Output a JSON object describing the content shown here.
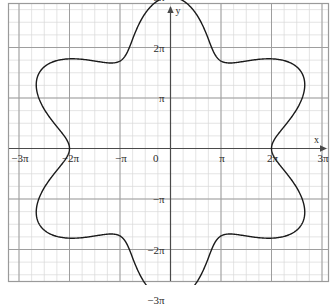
{
  "figure": {
    "title": "",
    "background_color": "#ffffff",
    "border_color": "#9a9a9a",
    "curve_color": "#1a1a1a",
    "axis_color": "#4a4a4a",
    "major_grid_color": "#9a9a9a",
    "minor_grid_color": "#d2d2d2"
  },
  "axes": {
    "x_axis_name": "x",
    "y_axis_name": "y",
    "origin_label": "0"
  },
  "x_ticks": [
    {
      "label": "−3π",
      "value": -3
    },
    {
      "label": "−2π",
      "value": -2
    },
    {
      "label": "−π",
      "value": -1
    },
    {
      "label": "0",
      "value": 0
    },
    {
      "label": "π",
      "value": 1
    },
    {
      "label": "2π",
      "value": 2
    },
    {
      "label": "3π",
      "value": 3
    }
  ],
  "y_ticks": [
    {
      "label": "3π",
      "value": 3
    },
    {
      "label": "2π",
      "value": 2
    },
    {
      "label": "π",
      "value": 1
    },
    {
      "label": "−π",
      "value": -1
    },
    {
      "label": "−2π",
      "value": -2
    },
    {
      "label": "−3π",
      "value": -3
    }
  ],
  "chart_data": {
    "type": "line",
    "title": "",
    "xlabel": "x",
    "ylabel": "y",
    "xlim": [
      -3.45,
      3.45
    ],
    "ylim": [
      -3.25,
      3.25
    ],
    "x_unit": "pi",
    "y_unit": "pi",
    "grid": true,
    "major_grid_step": 1,
    "minor_grid_step": 0.25,
    "legend": "none",
    "curve": {
      "name": "polar flower",
      "coordinate_system": "polar",
      "equation": "r = 5π/2 + (π/2)·cos(6θ)",
      "petals": 6,
      "r_max": 3,
      "r_min": 2,
      "r_max_label": "3π",
      "r_min_label": "2π",
      "cusp_angles_deg": [
        0,
        60,
        120,
        180,
        240,
        300
      ],
      "petal_tip_angles_deg": [
        30,
        90,
        150,
        210,
        270,
        330
      ],
      "closed": true,
      "stroke_width": 1.4
    },
    "annotations": []
  }
}
